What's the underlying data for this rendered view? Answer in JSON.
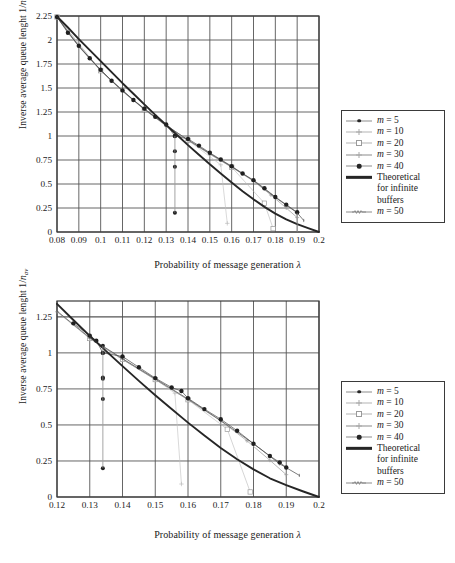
{
  "figure": {
    "background": "#ffffff",
    "axis_color": "#3a3a3a",
    "grid_color": "#5a5a5a",
    "theoretical_color": "#262626"
  },
  "charts": [
    {
      "id": "chart-top",
      "axis": {
        "ylabel_main": "Inverse average queue lenght 1/",
        "ylabel_italic": "n",
        "ylabel_sub": "av",
        "xlabel_main": "Probability of message generation ",
        "xlabel_symbol": "λ",
        "xticks": [
          "0.08",
          "0.09",
          "0.1",
          "0.11",
          "0.12",
          "0.13",
          "0.14",
          "0.15",
          "0.16",
          "0.17",
          "0.18",
          "0.19",
          "0.2"
        ],
        "yticks": [
          "0",
          "0.25",
          "0.5",
          "0.75",
          "1",
          "1.25",
          "1.5",
          "1.75",
          "2",
          "2.25"
        ]
      },
      "legend": {
        "items": [
          {
            "label": "m = 5",
            "marker": "dot",
            "line": "mid"
          },
          {
            "label": "m = 10",
            "marker": "plus",
            "line": "light"
          },
          {
            "label": "m = 20",
            "marker": "square",
            "line": "light"
          },
          {
            "label": "m = 30",
            "marker": "plus",
            "line": "mid"
          },
          {
            "label": "m = 40",
            "marker": "bigdot",
            "line": "mid"
          },
          {
            "label_lines": [
              "Theoretical",
              "for infinite",
              "buffers"
            ],
            "marker": "none",
            "line": "thick"
          },
          {
            "label": "m = 50",
            "marker": "zig",
            "line": "mid"
          }
        ]
      }
    },
    {
      "id": "chart-bottom",
      "axis": {
        "ylabel_main": "Inverse average queue lenght 1/",
        "ylabel_italic": "n",
        "ylabel_sub": "av",
        "xlabel_main": "Probability of message generation ",
        "xlabel_symbol": "λ",
        "xticks": [
          "0.12",
          "0.13",
          "0.14",
          "0.15",
          "0.16",
          "0.17",
          "0.18",
          "0.19",
          "0.2"
        ],
        "yticks": [
          "0",
          "0.25",
          "0.5",
          "0.75",
          "1",
          "1.25"
        ]
      },
      "legend": {
        "items": [
          {
            "label": "m = 5",
            "marker": "dot",
            "line": "mid"
          },
          {
            "label": "m = 10",
            "marker": "plus",
            "line": "light"
          },
          {
            "label": "m = 20",
            "marker": "square",
            "line": "light"
          },
          {
            "label": "m = 30",
            "marker": "plus",
            "line": "mid"
          },
          {
            "label": "m = 40",
            "marker": "bigdot",
            "line": "mid"
          },
          {
            "label_lines": [
              "Theoretical",
              "for infinite",
              "buffers"
            ],
            "marker": "none",
            "line": "thick"
          },
          {
            "label": "m = 50",
            "marker": "zig",
            "line": "mid"
          }
        ]
      }
    }
  ],
  "chart_data": [
    {
      "type": "line",
      "id": "top",
      "title": "",
      "xlabel": "Probability of message generation λ",
      "ylabel": "Inverse average queue lenght 1/n_av",
      "xlim": [
        0.08,
        0.2
      ],
      "ylim": [
        0.0,
        2.25
      ],
      "xticks": [
        0.08,
        0.09,
        0.1,
        0.11,
        0.12,
        0.13,
        0.14,
        0.15,
        0.16,
        0.17,
        0.18,
        0.19,
        0.2
      ],
      "yticks": [
        0,
        0.25,
        0.5,
        0.75,
        1,
        1.25,
        1.5,
        1.75,
        2,
        2.25
      ],
      "grid": true,
      "legend_position": "right-outside",
      "series": [
        {
          "name": "Theoretical for infinite buffers",
          "style": "thick-line",
          "x": [
            0.08,
            0.085,
            0.09,
            0.095,
            0.1,
            0.105,
            0.11,
            0.115,
            0.12,
            0.125,
            0.13,
            0.135,
            0.14,
            0.145,
            0.15,
            0.155,
            0.16,
            0.165,
            0.17,
            0.175,
            0.18,
            0.185,
            0.19,
            0.195,
            0.2
          ],
          "y": [
            2.245,
            2.13,
            2.01,
            1.895,
            1.78,
            1.665,
            1.55,
            1.44,
            1.33,
            1.22,
            1.115,
            1.01,
            0.905,
            0.805,
            0.705,
            0.61,
            0.515,
            0.425,
            0.34,
            0.262,
            0.192,
            0.132,
            0.082,
            0.04,
            0.0
          ]
        },
        {
          "name": "m = 40",
          "style": "markers-dot",
          "x": [
            0.08,
            0.085,
            0.09,
            0.095,
            0.1,
            0.105,
            0.11,
            0.115,
            0.12,
            0.125,
            0.13,
            0.134,
            0.14,
            0.145,
            0.15,
            0.155,
            0.16,
            0.165,
            0.17,
            0.175,
            0.18,
            0.185,
            0.19
          ],
          "y": [
            2.24,
            2.075,
            1.94,
            1.81,
            1.69,
            1.575,
            1.475,
            1.375,
            1.285,
            1.2,
            1.12,
            1.0,
            0.97,
            0.9,
            0.825,
            0.755,
            0.685,
            0.61,
            0.54,
            0.455,
            0.365,
            0.285,
            0.205
          ]
        },
        {
          "name": "m = 50",
          "style": "line-markers",
          "x": [
            0.08,
            0.09,
            0.1,
            0.11,
            0.12,
            0.13,
            0.14,
            0.15,
            0.16,
            0.17,
            0.18,
            0.19,
            0.193
          ],
          "y": [
            2.24,
            1.935,
            1.685,
            1.47,
            1.28,
            1.11,
            0.96,
            0.818,
            0.68,
            0.535,
            0.36,
            0.2,
            0.12
          ]
        },
        {
          "name": "m = 30",
          "style": "light-markers",
          "x": [
            0.08,
            0.09,
            0.1,
            0.11,
            0.12,
            0.13,
            0.14,
            0.15,
            0.16,
            0.17,
            0.178,
            0.185,
            0.19
          ],
          "y": [
            2.24,
            1.93,
            1.68,
            1.465,
            1.275,
            1.105,
            0.955,
            0.81,
            0.675,
            0.53,
            0.385,
            0.25,
            0.15
          ]
        },
        {
          "name": "m = 20",
          "style": "open-square",
          "x": [
            0.08,
            0.1,
            0.12,
            0.14,
            0.16,
            0.175,
            0.179
          ],
          "y": [
            2.24,
            1.68,
            1.275,
            0.955,
            0.675,
            0.3,
            0.035
          ]
        },
        {
          "name": "m = 10",
          "style": "plus",
          "x": [
            0.08,
            0.1,
            0.12,
            0.14,
            0.155,
            0.158
          ],
          "y": [
            2.24,
            1.68,
            1.275,
            0.955,
            0.7,
            0.09
          ]
        },
        {
          "name": "m = 5",
          "style": "dot-small",
          "x": [
            0.134,
            0.134,
            0.134,
            0.134
          ],
          "y": [
            1.0,
            0.84,
            0.68,
            0.2
          ]
        }
      ],
      "annotations": [
        {
          "text": "vertical scatter of outliers at λ ≈ 0.134",
          "x": 0.134,
          "y_range": [
            0.2,
            1.0
          ]
        },
        {
          "text": "vertical scatter of outliers at λ ≈ 0.19",
          "x": 0.19,
          "y_range": [
            0.0,
            0.2
          ]
        }
      ]
    },
    {
      "type": "line",
      "id": "bottom",
      "title": "",
      "xlabel": "Probability of message generation λ",
      "ylabel": "Inverse average queue lenght 1/n_av",
      "xlim": [
        0.12,
        0.2
      ],
      "ylim": [
        0.0,
        1.36
      ],
      "xticks": [
        0.12,
        0.13,
        0.14,
        0.15,
        0.16,
        0.17,
        0.18,
        0.19,
        0.2
      ],
      "yticks": [
        0,
        0.25,
        0.5,
        0.75,
        1,
        1.25
      ],
      "grid": true,
      "legend_position": "right-outside",
      "series": [
        {
          "name": "Theoretical for infinite buffers",
          "style": "thick-line",
          "x": [
            0.12,
            0.125,
            0.13,
            0.135,
            0.14,
            0.145,
            0.15,
            0.155,
            0.16,
            0.165,
            0.17,
            0.175,
            0.18,
            0.185,
            0.19,
            0.195,
            0.2
          ],
          "y": [
            1.34,
            1.228,
            1.118,
            1.012,
            0.908,
            0.806,
            0.706,
            0.61,
            0.516,
            0.426,
            0.34,
            0.262,
            0.192,
            0.13,
            0.082,
            0.04,
            0.0
          ]
        },
        {
          "name": "m = 40",
          "style": "markers-dot",
          "x": [
            0.125,
            0.13,
            0.132,
            0.134,
            0.14,
            0.145,
            0.15,
            0.155,
            0.158,
            0.16,
            0.165,
            0.17,
            0.175,
            0.18,
            0.185,
            0.188,
            0.19
          ],
          "y": [
            1.205,
            1.12,
            1.085,
            1.0,
            0.975,
            0.9,
            0.825,
            0.76,
            0.735,
            0.685,
            0.61,
            0.54,
            0.46,
            0.37,
            0.285,
            0.24,
            0.205
          ]
        },
        {
          "name": "m = 50",
          "style": "line-markers",
          "x": [
            0.12,
            0.13,
            0.14,
            0.15,
            0.16,
            0.17,
            0.18,
            0.188,
            0.194
          ],
          "y": [
            1.29,
            1.105,
            0.96,
            0.82,
            0.68,
            0.53,
            0.37,
            0.23,
            0.15
          ]
        },
        {
          "name": "m = 30",
          "style": "light-markers",
          "x": [
            0.12,
            0.13,
            0.14,
            0.15,
            0.16,
            0.17,
            0.178,
            0.185,
            0.19
          ],
          "y": [
            1.285,
            1.1,
            0.955,
            0.815,
            0.675,
            0.528,
            0.39,
            0.255,
            0.155
          ]
        },
        {
          "name": "m = 20",
          "style": "open-square",
          "x": [
            0.13,
            0.14,
            0.15,
            0.16,
            0.172,
            0.179
          ],
          "y": [
            1.1,
            0.955,
            0.815,
            0.675,
            0.47,
            0.035
          ]
        },
        {
          "name": "m = 10",
          "style": "plus",
          "x": [
            0.13,
            0.14,
            0.15,
            0.156,
            0.158
          ],
          "y": [
            1.1,
            0.955,
            0.818,
            0.72,
            0.09
          ]
        },
        {
          "name": "m = 5",
          "style": "dot-small",
          "x": [
            0.134,
            0.134,
            0.134,
            0.134,
            0.134
          ],
          "y": [
            1.05,
            0.83,
            0.82,
            0.68,
            0.2
          ]
        }
      ],
      "annotations": [
        {
          "text": "vertical scatter of outliers at λ ≈ 0.134",
          "x": 0.134,
          "y_range": [
            0.2,
            1.05
          ]
        },
        {
          "text": "outlier point at λ ≈ 0.19",
          "x": 0.19,
          "y": 0.03
        }
      ]
    }
  ]
}
